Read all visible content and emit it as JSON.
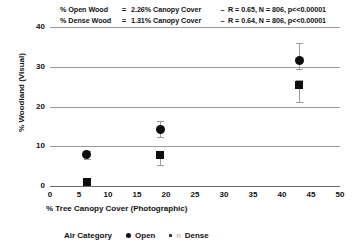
{
  "annotations": {
    "line1": {
      "lhs": "% Open Wood",
      "eq": "=",
      "rhs": "2.26% Canopy Cover",
      "dash": "–",
      "stats": "R = 0.65, N = 806, p<<0.00001"
    },
    "line2": {
      "lhs": "% Dense Wood",
      "eq": "=",
      "rhs": "1.31% Canopy Cover",
      "dash": "–",
      "stats": "R = 0.64, N = 806, p<<0.00001"
    }
  },
  "legend": {
    "title": "Air Category",
    "entries": [
      {
        "label": "Open",
        "marker": "circle-marker",
        "color": "#0d0d0d"
      },
      {
        "label": "Dense",
        "marker": "square-marker",
        "color": "#0d0d0d"
      }
    ],
    "ghost_glyph": "n"
  },
  "chart_data": {
    "type": "scatter",
    "title": "",
    "xlabel": "% Tree Canopy Cover (Photographic)",
    "ylabel": "% Woodland (Visual)",
    "xlim": [
      0,
      50
    ],
    "ylim": [
      0,
      40
    ],
    "xticks": [
      0,
      5,
      10,
      15,
      20,
      25,
      30,
      35,
      40,
      45,
      50
    ],
    "yticks": [
      0,
      10,
      20,
      30,
      40
    ],
    "grid": "horizontal",
    "legend_position": "bottom",
    "series": [
      {
        "name": "Open",
        "marker": "circle",
        "color": "#0d0d0d",
        "points": [
          {
            "x": 6.3,
            "y": 7.8,
            "yerr_low": 0.9,
            "yerr_high": 0.9
          },
          {
            "x": 19.0,
            "y": 14.2,
            "yerr_low": 1.8,
            "yerr_high": 2.2
          },
          {
            "x": 43.0,
            "y": 31.5,
            "yerr_low": 2.0,
            "yerr_high": 4.5
          }
        ]
      },
      {
        "name": "Dense",
        "marker": "square",
        "color": "#0d0d0d",
        "points": [
          {
            "x": 6.3,
            "y": 1.0,
            "yerr_low": 0.6,
            "yerr_high": 0.6
          },
          {
            "x": 19.0,
            "y": 7.7,
            "yerr_low": 2.4,
            "yerr_high": 0.8
          },
          {
            "x": 43.0,
            "y": 25.5,
            "yerr_low": 4.3,
            "yerr_high": 1.2
          }
        ]
      }
    ],
    "fits": [
      {
        "name": "Open Wood",
        "slope_pct": 2.26,
        "R": 0.65,
        "N": 806,
        "p": "<<0.00001"
      },
      {
        "name": "Dense Wood",
        "slope_pct": 1.31,
        "R": 0.64,
        "N": 806,
        "p": "<<0.00001"
      }
    ]
  }
}
